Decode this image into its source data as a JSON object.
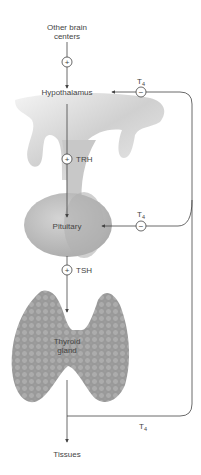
{
  "labels": {
    "other_brain_centers_line1": "Other brain",
    "other_brain_centers_line2": "centers",
    "hypothalamus": "Hypothalamus",
    "trh": "TRH",
    "pituitary": "Pituitary",
    "tsh": "TSH",
    "thyroid_line1": "Thyroid",
    "thyroid_line2": "gland",
    "tissues": "Tissues",
    "t4_main": "T",
    "t4_sub": "4"
  },
  "signs": {
    "plus": "+",
    "minus": "−"
  },
  "colors": {
    "line": "#444444",
    "hypothalamus_fill": "#d9d9d9",
    "pituitary_fill": "#bdbdbd",
    "thyroid_fill": "#9a9a9a"
  }
}
